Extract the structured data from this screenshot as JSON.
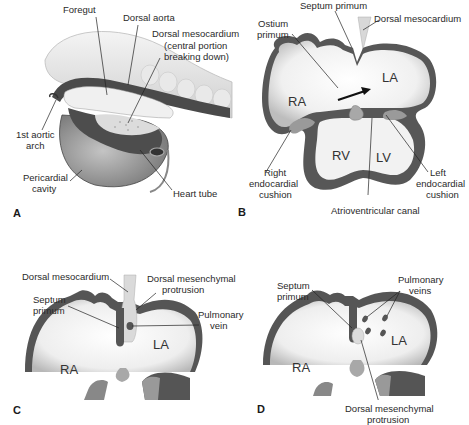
{
  "figure": {
    "panels": [
      {
        "id": "A",
        "panel_label": "A",
        "labels": {
          "foregut": "Foregut",
          "dorsal_aorta": "Dorsal aorta",
          "dorsal_mesocardium": "Dorsal mesocardium",
          "dorsal_mesocardium_note_1": "(central portion",
          "dorsal_mesocardium_note_2": "breaking down)",
          "first_aortic_arch_1": "1st aortic",
          "first_aortic_arch_2": "arch",
          "pericardial_cavity_1": "Pericardial",
          "pericardial_cavity_2": "cavity",
          "heart_tube": "Heart tube"
        }
      },
      {
        "id": "B",
        "panel_label": "B",
        "labels": {
          "septum_primum": "Septum primum",
          "dorsal_mesocardium": "Dorsal mesocardium",
          "ostium_primum_1": "Ostium",
          "ostium_primum_2": "primum",
          "ra": "RA",
          "la": "LA",
          "rv": "RV",
          "lv": "LV",
          "right_endocardial_cushion_1": "Right",
          "right_endocardial_cushion_2": "endocardial",
          "right_endocardial_cushion_3": "cushion",
          "left_endocardial_cushion_1": "Left",
          "left_endocardial_cushion_2": "endocardial",
          "left_endocardial_cushion_3": "cushion",
          "atrioventricular_canal": "Atrioventricular canal"
        }
      },
      {
        "id": "C",
        "panel_label": "C",
        "labels": {
          "dorsal_mesocardium": "Dorsal mesocardium",
          "dorsal_mesenchymal_protrusion_1": "Dorsal mesenchymal",
          "dorsal_mesenchymal_protrusion_2": "protrusion",
          "septum_primum_1": "Septum",
          "septum_primum_2": "primum",
          "pulmonary_vein_1": "Pulmonary",
          "pulmonary_vein_2": "vein",
          "ra": "RA",
          "la": "LA"
        }
      },
      {
        "id": "D",
        "panel_label": "D",
        "labels": {
          "septum_primum_1": "Septum",
          "septum_primum_2": "primum",
          "pulmonary_veins_1": "Pulmonary",
          "pulmonary_veins_2": "veins",
          "ra": "RA",
          "la": "LA",
          "dorsal_mesenchymal_protrusion_1": "Dorsal mesenchymal",
          "dorsal_mesenchymal_protrusion_2": "protrusion"
        }
      }
    ],
    "colors": {
      "wall": "#555555",
      "chamber_fill": "#e8e8e8",
      "cushion": "#9a9a9a",
      "mesocardium": "#d4d4d4",
      "leader": "#222222"
    }
  }
}
